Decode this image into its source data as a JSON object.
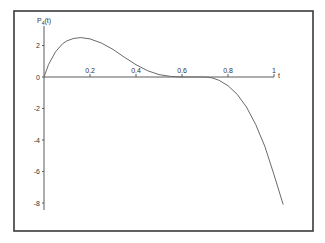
{
  "chart_data": {
    "type": "line",
    "title": "",
    "xlabel": "t",
    "ylabel": "P4(t)",
    "ylabel_main": "P",
    "ylabel_sub": "4",
    "ylabel_arg": "(t)",
    "xlim": [
      0,
      1.04
    ],
    "ylim": [
      -8.5,
      3
    ],
    "grid": false,
    "legend": null,
    "x_ticks": [
      {
        "value": 0.2,
        "label": "0.2"
      },
      {
        "value": 0.4,
        "label": "0.4"
      },
      {
        "value": 0.6,
        "label": "0.6"
      },
      {
        "value": 0.8,
        "label": "0.8"
      },
      {
        "value": 1.0,
        "label": "1"
      }
    ],
    "y_ticks": [
      {
        "value": 2,
        "label": "2"
      },
      {
        "value": 0,
        "label": "0"
      },
      {
        "value": -2,
        "label": "-2"
      },
      {
        "value": -4,
        "label": "-4"
      },
      {
        "value": -6,
        "label": "-6"
      },
      {
        "value": -8,
        "label": "-8"
      }
    ],
    "series": [
      {
        "name": "P4(t)",
        "x": [
          0,
          0.02,
          0.05,
          0.08,
          0.1,
          0.13,
          0.16,
          0.2,
          0.25,
          0.3,
          0.35,
          0.4,
          0.45,
          0.5,
          0.55,
          0.6,
          0.65,
          0.7,
          0.73,
          0.76,
          0.8,
          0.84,
          0.88,
          0.92,
          0.96,
          1.0,
          1.04
        ],
        "values": [
          0,
          0.8,
          1.6,
          2.1,
          2.3,
          2.45,
          2.5,
          2.42,
          2.15,
          1.75,
          1.25,
          0.78,
          0.4,
          0.15,
          0.04,
          0.0,
          0.0,
          0.0,
          -0.05,
          -0.2,
          -0.55,
          -1.1,
          -1.9,
          -3.0,
          -4.4,
          -6.2,
          -8.1
        ]
      }
    ]
  },
  "plot_layout": {
    "frame": {
      "x": 14,
      "y": 11,
      "w": 299,
      "h": 220
    },
    "origin_px": {
      "x": 44,
      "y": 77
    },
    "x_scale_px_per_unit": 230,
    "y_scale_px_per_unit": 15.75,
    "y_axis_top_px": 26,
    "y_axis_bottom_px": 210,
    "x_axis_right_px": 274
  }
}
